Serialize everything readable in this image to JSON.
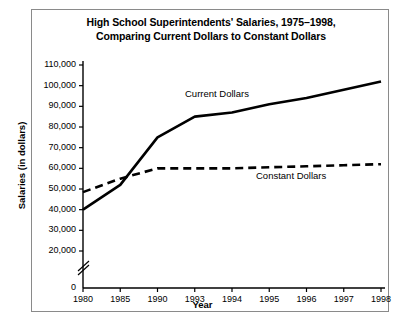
{
  "chart_data": {
    "type": "line",
    "title": "High School Superintendents' Salaries, 1975–1998, Comparing Current Dollars to Constant Dollars",
    "title_line1": "High School Superintendents' Salaries, 1975–1998,",
    "title_line2": "Comparing Current Dollars to Constant Dollars",
    "xlabel": "Year",
    "ylabel": "Salaries (in dollars)",
    "categories": [
      "1980",
      "1985",
      "1990",
      "1993",
      "1994",
      "1995",
      "1996",
      "1997",
      "1998"
    ],
    "ylim": [
      20000,
      110000
    ],
    "yticks": [
      20000,
      30000,
      40000,
      50000,
      60000,
      70000,
      80000,
      90000,
      100000,
      110000
    ],
    "ytick_labels": [
      "20,000",
      "30,000",
      "40,000",
      "50,000",
      "60,000",
      "70,000",
      "80,000",
      "90,000",
      "100,000",
      "110,000"
    ],
    "zero_label": "0",
    "axis_break": true,
    "axis_break_symbol": "double-slash",
    "grid": false,
    "legend_position": "inline-annotations",
    "series": [
      {
        "name": "Current Dollars",
        "style": "solid",
        "color": "#000000",
        "values": [
          40000,
          52000,
          75000,
          85000,
          87000,
          91000,
          94000,
          98000,
          102000
        ]
      },
      {
        "name": "Constant Dollars",
        "style": "dashed",
        "color": "#000000",
        "values": [
          48500,
          55000,
          60000,
          60000,
          60000,
          60500,
          61000,
          61500,
          62000
        ]
      }
    ],
    "annotations": [
      {
        "text": "Current Dollars",
        "series": "Current Dollars",
        "x": 185,
        "y": 88
      },
      {
        "text": "Constant Dollars",
        "series": "Constant Dollars",
        "x": 256,
        "y": 170
      }
    ]
  }
}
